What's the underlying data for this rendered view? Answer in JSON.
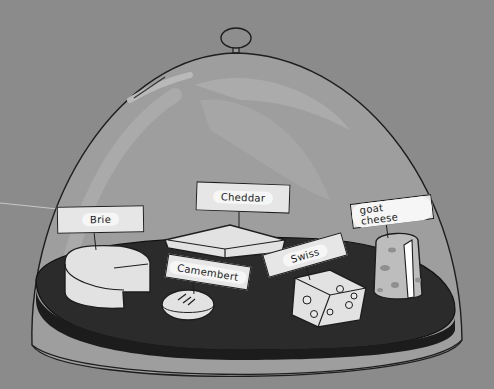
{
  "scene": {
    "description": "Cheese dome illustration with labeled cheeses on a dark platter",
    "colors": {
      "background": "#8b8b8b",
      "dome": "#9d9d9d",
      "platter": "#2a2a2a",
      "cheese": "#e2e2e2",
      "label": "#e6e6e6"
    }
  },
  "labels": {
    "brie": "Brie",
    "cheddar": "Cheddar",
    "camembert": "Camembert",
    "swiss": "Swiss",
    "goat_cheese": "goat cheese"
  }
}
